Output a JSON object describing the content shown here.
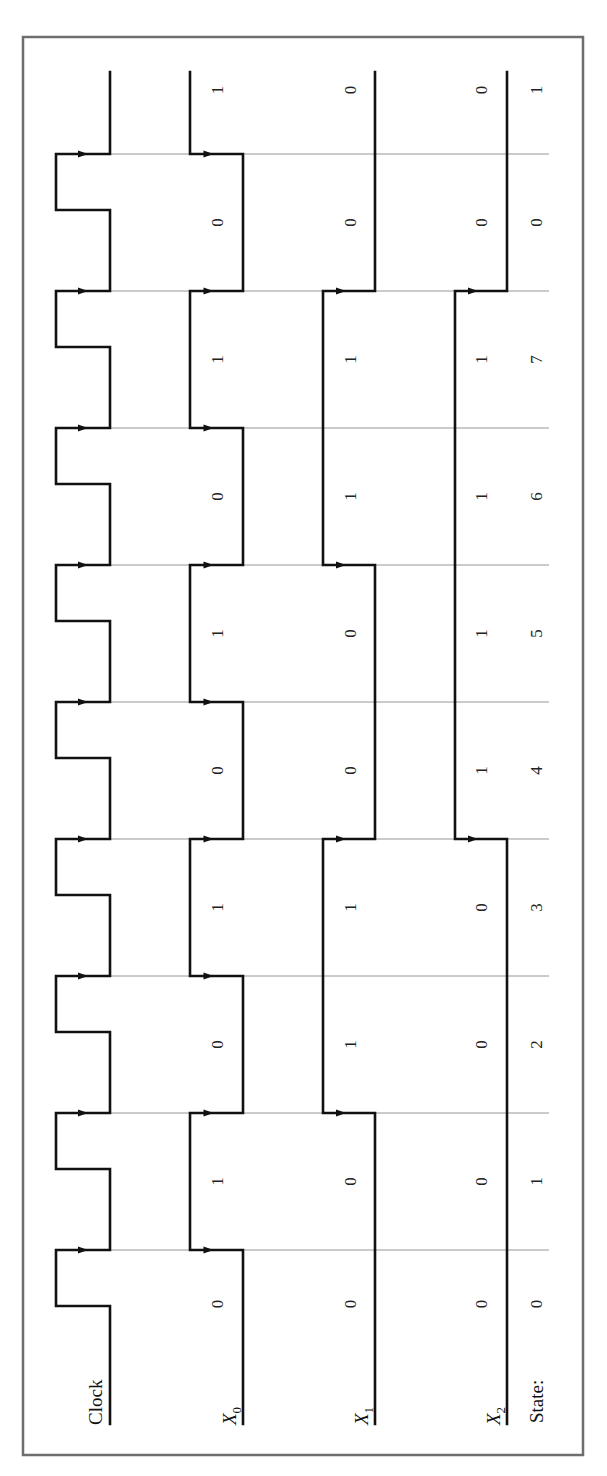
{
  "figure": {
    "orientation": "rotated-90-ccw",
    "signal_labels": {
      "clock": "Clock",
      "x0_base": "X",
      "x0_sub": "0",
      "x1_base": "X",
      "x1_sub": "1",
      "x2_base": "X",
      "x2_sub": "2",
      "state": "State:"
    },
    "colors": {
      "frame": "#6e6e6e",
      "wave": "#111111",
      "grid": "#8a8a8a"
    }
  },
  "chart_data": {
    "type": "timing",
    "title": "",
    "time_axis": "increases upward (rotated page)",
    "num_periods": 10,
    "clock_edges_arrowed": true,
    "signals": [
      {
        "name": "Clock",
        "type": "clock"
      },
      {
        "name": "X0",
        "values": [
          0,
          1,
          0,
          1,
          0,
          1,
          0,
          1,
          0,
          1
        ]
      },
      {
        "name": "X1",
        "values": [
          0,
          0,
          1,
          1,
          0,
          0,
          1,
          1,
          0,
          0
        ]
      },
      {
        "name": "X2",
        "values": [
          0,
          0,
          0,
          0,
          1,
          1,
          1,
          1,
          0,
          0
        ]
      }
    ],
    "state_labels": [
      "0",
      "1",
      "2",
      "3",
      "4",
      "5",
      "6",
      "7",
      "0",
      "1"
    ]
  }
}
